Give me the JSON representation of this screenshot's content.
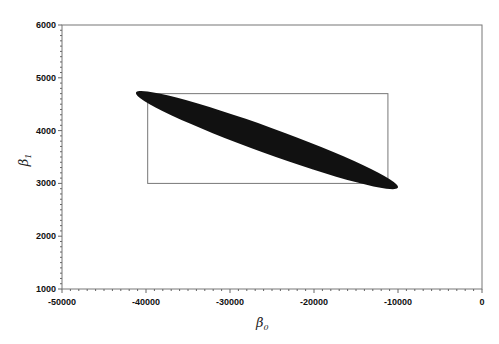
{
  "chart_data": {
    "type": "scatter",
    "title": "",
    "xlabel": "β0",
    "ylabel": "β1",
    "xlim": [
      -50000,
      0
    ],
    "ylim": [
      1000,
      6000
    ],
    "grid": false,
    "legend": null,
    "x_ticks": [
      -50000,
      -40000,
      -30000,
      -20000,
      -10000,
      0
    ],
    "y_ticks": [
      1000,
      2000,
      3000,
      4000,
      5000,
      6000
    ],
    "x_tick_labels": [
      "-50000",
      "-40000",
      "-30000",
      "-20000",
      "-10000",
      "0"
    ],
    "y_tick_labels": [
      "1000",
      "2000",
      "3000",
      "4000",
      "5000",
      "6000"
    ],
    "shapes": [
      {
        "name": "joint-confidence-ellipse",
        "kind": "filled-ellipse",
        "color": "#111111",
        "center": [
          -25600,
          3820
        ],
        "endpoint_left": [
          -41200,
          4720
        ],
        "endpoint_right": [
          -10000,
          2920
        ]
      },
      {
        "name": "individual-confidence-rectangle",
        "kind": "rectangle-outline",
        "color": "#777777",
        "x_range": [
          -39800,
          -11200
        ],
        "y_range": [
          3000,
          4700
        ]
      }
    ]
  },
  "axes": {
    "x_label_main": "β",
    "x_label_sub": "0",
    "y_label_main": "β",
    "y_label_sub": "1"
  }
}
